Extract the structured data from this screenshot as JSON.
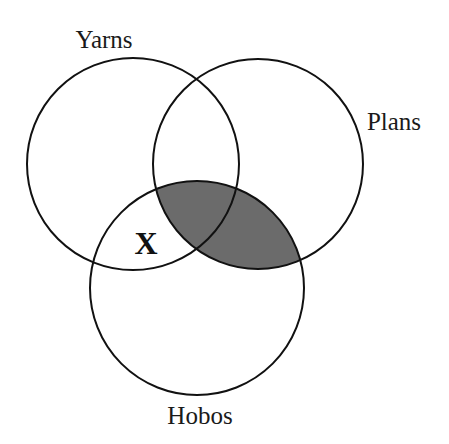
{
  "diagram": {
    "type": "venn-3",
    "sets": [
      {
        "id": "yarns",
        "label": "Yarns",
        "cx": 133,
        "cy": 164,
        "r": 106,
        "label_x": 104,
        "label_y": 48
      },
      {
        "id": "plans",
        "label": "Plans",
        "cx": 258,
        "cy": 164,
        "r": 105,
        "label_x": 394,
        "label_y": 130
      },
      {
        "id": "hobos",
        "label": "Hobos",
        "cx": 197,
        "cy": 288,
        "r": 107,
        "label_x": 200,
        "label_y": 424
      }
    ],
    "shaded_region": {
      "description": "Plans ∩ Hobos",
      "sets": [
        "plans",
        "hobos"
      ],
      "color": "#6b6b6b"
    },
    "markers": [
      {
        "text": "X",
        "region": "Yarns ∩ Hobos only",
        "x": 146,
        "y": 254
      }
    ],
    "stroke_color": "#111111",
    "background": "#ffffff"
  }
}
